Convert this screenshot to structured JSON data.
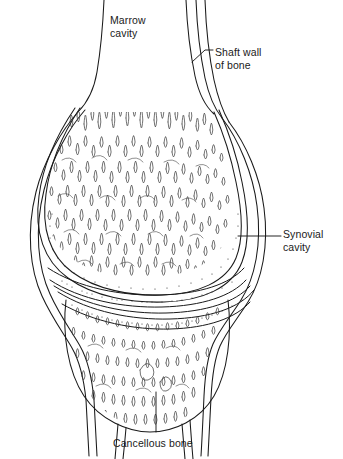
{
  "figure": {
    "background_color": "#ffffff",
    "ink_color": "#1a1a1a",
    "width": 343,
    "height": 459
  },
  "labels": {
    "marrow_cavity": "Marrow\ncavity",
    "shaft_wall": "Shaft wall\nof bone",
    "synovial_cavity": "Synovial\ncavity",
    "cancellous_bone": "Cancellous bone"
  },
  "structures": {
    "upper_epiphysis": "upper-epiphysis-trabeculae",
    "lower_epiphysis": "lower-epiphysis-trabeculae",
    "articular_cartilage_upper": "upper-articular-cartilage",
    "articular_cartilage_lower": "lower-articular-cartilage",
    "joint_capsule": "joint-capsule",
    "cortical_shell": "cortical-bone-shell",
    "upper_shaft": "upper-bone-shaft",
    "lower_shaft": "lower-bone-shaft"
  }
}
